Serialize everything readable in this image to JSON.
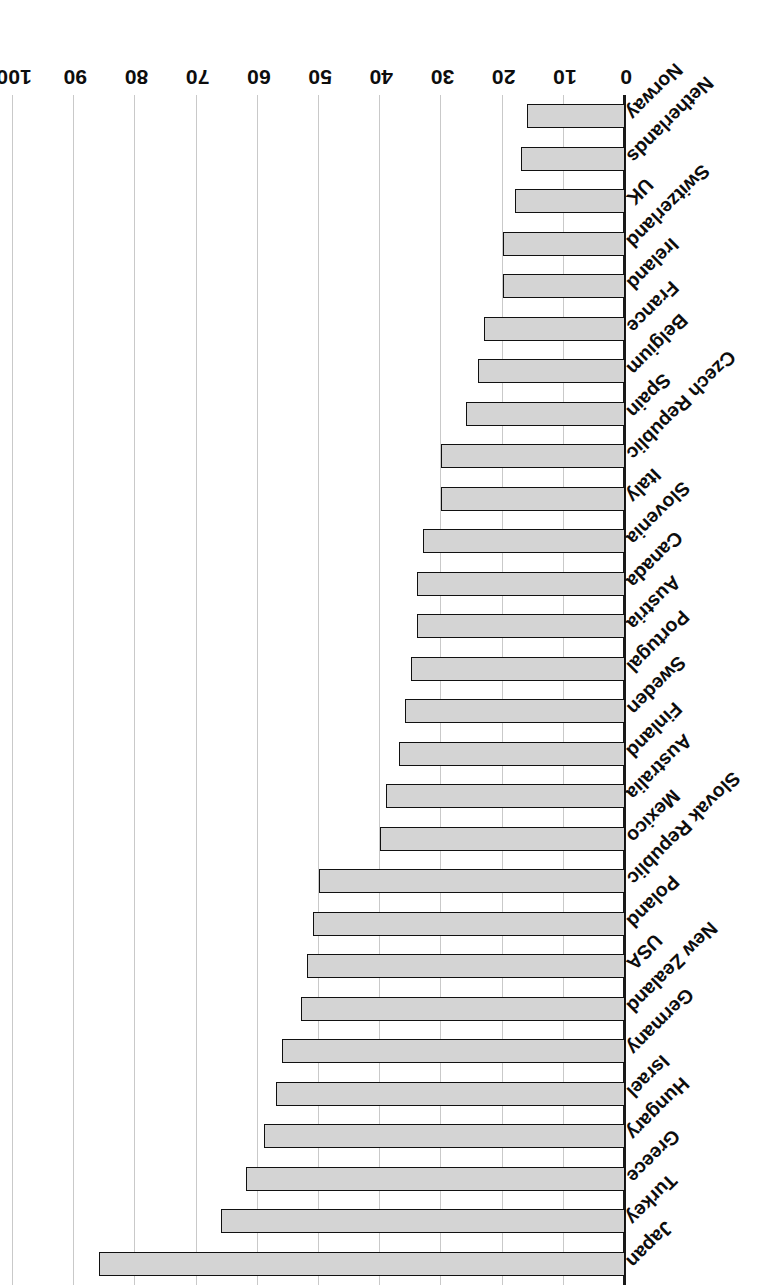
{
  "chart_data": {
    "type": "bar",
    "orientation": "horizontal",
    "title": "",
    "subtitle": "",
    "xlabel": "",
    "ylabel": "",
    "xlim": [
      0,
      100
    ],
    "ticks": [
      0,
      10,
      20,
      30,
      40,
      50,
      60,
      70,
      80,
      90,
      100
    ],
    "grid": true,
    "legend": false,
    "bar_fill": "#d4d4d4",
    "bar_stroke": "#111111",
    "categories": [
      "Japan",
      "Turkey",
      "Greece",
      "Hungary",
      "Israel",
      "Germany",
      "New Zealand",
      "USA",
      "Poland",
      "Slovak Republic",
      "Mexico",
      "Australia",
      "Finland",
      "Sweden",
      "Portugal",
      "Austria",
      "Canada",
      "Slovenia",
      "Italy",
      "Czech Republic",
      "Spain",
      "Belgium",
      "France",
      "Ireland",
      "Switzerland",
      "UK",
      "Netherlands",
      "Norway"
    ],
    "values": [
      86,
      66,
      62,
      59,
      57,
      56,
      53,
      52,
      51,
      50,
      40,
      39,
      37,
      36,
      35,
      34,
      34,
      33,
      30,
      30,
      26,
      24,
      23,
      20,
      20,
      18,
      17,
      16
    ]
  },
  "tick_labels": [
    "0",
    "10",
    "20",
    "30",
    "40",
    "50",
    "60",
    "70",
    "80",
    "90",
    "100"
  ]
}
